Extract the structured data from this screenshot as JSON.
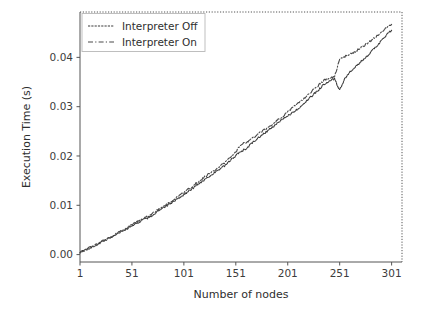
{
  "figure": {
    "background_color": "#ffffff",
    "axis_color": "#555555",
    "text_color": "#2e2e2e"
  },
  "axes": {
    "xlabel": "Number of nodes",
    "ylabel": "Execution Time (s)",
    "x_ticks": [
      "1",
      "51",
      "101",
      "151",
      "201",
      "251",
      "301"
    ],
    "y_ticks": [
      "0.00",
      "0.01",
      "0.02",
      "0.03",
      "0.04"
    ]
  },
  "legend": {
    "entries": [
      {
        "label": "Interpreter Off",
        "style": "solid",
        "color": "#3a3a3a"
      },
      {
        "label": "Interpreter On",
        "style": "dashdot",
        "color": "#4a4a4a"
      }
    ]
  },
  "chart_data": {
    "type": "line",
    "title": "",
    "xlabel": "Number of nodes",
    "ylabel": "Execution Time (s)",
    "xlim": [
      1,
      311
    ],
    "ylim": [
      -0.0015,
      0.0492
    ],
    "x_ticks": [
      1,
      51,
      101,
      151,
      201,
      251,
      301
    ],
    "y_ticks": [
      0.0,
      0.01,
      0.02,
      0.03,
      0.04
    ],
    "grid": false,
    "legend_position": "upper left",
    "x": [
      1,
      6,
      11,
      16,
      21,
      26,
      31,
      36,
      41,
      46,
      51,
      56,
      61,
      66,
      71,
      76,
      81,
      86,
      91,
      96,
      101,
      106,
      111,
      116,
      121,
      126,
      131,
      136,
      141,
      146,
      151,
      156,
      161,
      166,
      171,
      176,
      181,
      186,
      191,
      196,
      201,
      206,
      211,
      216,
      221,
      226,
      231,
      236,
      241,
      246,
      251,
      256,
      261,
      266,
      271,
      276,
      281,
      286,
      291,
      296,
      301
    ],
    "series": [
      {
        "name": "Interpreter Off",
        "style": "solid",
        "color": "#3a3a3a",
        "values": [
          0.0005,
          0.0009,
          0.0014,
          0.0019,
          0.00245,
          0.003,
          0.00355,
          0.00415,
          0.0047,
          0.0052,
          0.0059,
          0.0064,
          0.007,
          0.00745,
          0.008,
          0.0088,
          0.0094,
          0.0101,
          0.0108,
          0.0115,
          0.0122,
          0.0129,
          0.0137,
          0.0145,
          0.0152,
          0.016,
          0.0166,
          0.0174,
          0.0181,
          0.0191,
          0.0201,
          0.0209,
          0.0215,
          0.0225,
          0.0234,
          0.0242,
          0.025,
          0.0258,
          0.0266,
          0.0274,
          0.0282,
          0.0288,
          0.0296,
          0.0306,
          0.0315,
          0.0325,
          0.0335,
          0.0346,
          0.0352,
          0.0356,
          0.0333,
          0.0358,
          0.037,
          0.038,
          0.039,
          0.0401,
          0.041,
          0.0422,
          0.0433,
          0.0445,
          0.0455
        ]
      },
      {
        "name": "Interpreter On",
        "style": "dashdot",
        "color": "#4a4a4a",
        "values": [
          0.00055,
          0.00095,
          0.00148,
          0.002,
          0.00255,
          0.00312,
          0.00368,
          0.00428,
          0.00485,
          0.0054,
          0.0062,
          0.00675,
          0.00725,
          0.0077,
          0.0083,
          0.0091,
          0.00975,
          0.01045,
          0.01115,
          0.01185,
          0.01265,
          0.0134,
          0.0142,
          0.015,
          0.01575,
          0.0165,
          0.0172,
          0.018,
          0.01875,
          0.01975,
          0.02085,
          0.0223,
          0.0228,
          0.0234,
          0.0242,
          0.025,
          0.0256,
          0.0264,
          0.0272,
          0.028,
          0.0289,
          0.0298,
          0.0307,
          0.0316,
          0.0325,
          0.0335,
          0.0344,
          0.0353,
          0.0358,
          0.036,
          0.0396,
          0.0402,
          0.0406,
          0.0412,
          0.0419,
          0.0426,
          0.0434,
          0.0442,
          0.0451,
          0.046,
          0.0467
        ]
      }
    ]
  }
}
